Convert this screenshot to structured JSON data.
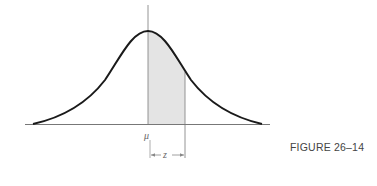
{
  "figure": {
    "caption": "FIGURE 26–14",
    "mean_label": "μ",
    "z_label": "z"
  },
  "colors": {
    "curve": "#1a1a1a",
    "axis": "#888888",
    "shade": "#e4e4e4",
    "text": "#555555"
  },
  "diagram": {
    "type": "normal-distribution",
    "shaded_region": {
      "from": "μ",
      "to": "z"
    },
    "annotations": [
      "μ",
      "z",
      "FIGURE 26–14"
    ]
  }
}
